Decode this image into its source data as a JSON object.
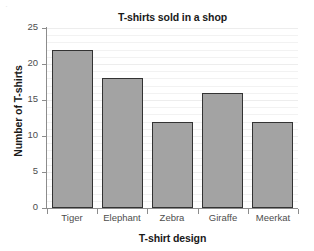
{
  "chart_data": {
    "type": "bar",
    "title": "T-shirts sold in a shop",
    "xlabel": "T-shirt design",
    "ylabel": "Number of T-shirts",
    "categories": [
      "Tiger",
      "Elephant",
      "Zebra",
      "Giraffe",
      "Meerkat"
    ],
    "values": [
      22,
      18,
      12,
      16,
      12
    ],
    "ylim": [
      0,
      25
    ],
    "ytick_labels": [
      "0",
      "5",
      "10",
      "15",
      "20",
      "25"
    ],
    "ytick_values": [
      0,
      5,
      10,
      15,
      20,
      25
    ],
    "grid": true,
    "legend": null,
    "series": [
      {
        "name": "T-shirts sold",
        "values": [
          22,
          18,
          12,
          16,
          12
        ]
      }
    ],
    "colors": {
      "bar_fill": "#a3a3a3",
      "bar_border": "#333333",
      "axis": "#8c8c8c",
      "grid": "#f2f2f2",
      "text": "#1a1a1a",
      "tick_text": "#4d4d4d",
      "background": "#ffffff"
    }
  },
  "artifact": {
    "glyph": "·"
  }
}
